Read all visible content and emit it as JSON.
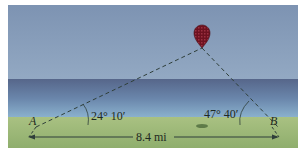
{
  "figure": {
    "point_a_label": "A",
    "point_b_label": "B",
    "angle_a_label": "24° 10′",
    "angle_b_label": "47° 40′",
    "distance_label": "8.4 mi",
    "colors": {
      "sky_top": "#7f95b3",
      "sky_bottom": "#8ea4bf",
      "sea_top": "#5d6d8f",
      "sea_bottom": "#7ea6c6",
      "grass": "#9fba7c",
      "grass_dark": "#8fae6d",
      "balloon": "#7a1a24",
      "line": "#2f3f3a"
    }
  }
}
